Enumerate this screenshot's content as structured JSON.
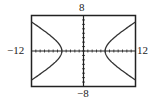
{
  "chart_data": {
    "type": "line",
    "title": "",
    "equation": "x^2/25 - y^2/9 = 1",
    "xlim": [
      -12,
      12
    ],
    "ylim": [
      -8,
      8
    ],
    "tick_labels": {
      "xmin": "−12",
      "xmax": "12",
      "ymin": "−8",
      "ymax": "8"
    },
    "xscale": 1,
    "yscale": 1,
    "grid": false,
    "series": [
      {
        "name": "right branch",
        "vertex": [
          5,
          0
        ],
        "points": [
          [
            12,
            6.5
          ],
          [
            9,
            4.5
          ],
          [
            7,
            2.9
          ],
          [
            6,
            2
          ],
          [
            5,
            0
          ],
          [
            6,
            -2
          ],
          [
            7,
            -2.9
          ],
          [
            9,
            -4.5
          ],
          [
            12,
            -6.5
          ]
        ]
      },
      {
        "name": "left branch",
        "vertex": [
          -5,
          0
        ],
        "points": [
          [
            -12,
            6.5
          ],
          [
            -9,
            4.5
          ],
          [
            -7,
            2.9
          ],
          [
            -6,
            2
          ],
          [
            -5,
            0
          ],
          [
            -6,
            -2
          ],
          [
            -7,
            -2.9
          ],
          [
            -9,
            -4.5
          ],
          [
            -12,
            -6.5
          ]
        ]
      }
    ],
    "xlabel": "",
    "ylabel": ""
  }
}
